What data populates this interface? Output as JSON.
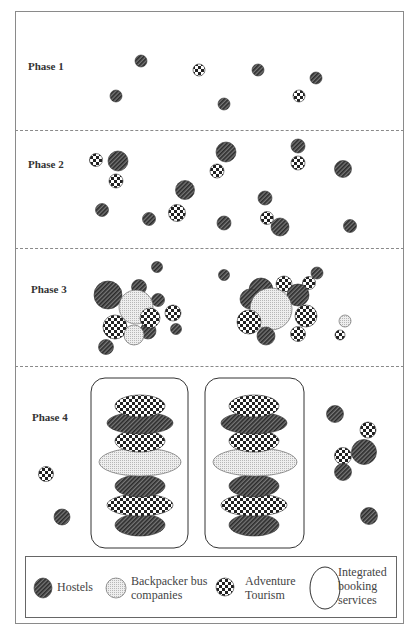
{
  "figure": {
    "phases": [
      {
        "label": "Phase 1"
      },
      {
        "label": "Phase 2"
      },
      {
        "label": "Phase 3"
      },
      {
        "label": "Phase 4"
      }
    ],
    "legend": {
      "hostels": "Hostels",
      "bus_line1": "Backpacker bus",
      "bus_line2": "companies",
      "adventure_line1": "Adventure",
      "adventure_line2": "Tourism",
      "booking_line1": "Integrated",
      "booking_line2": "booking",
      "booking_line3": "services"
    },
    "colors": {
      "hatch_dark": "#333333",
      "hatch_light": "#777777",
      "dot_fill": "#e8e8e8",
      "check_dark": "#222222",
      "frame": "#8a8a8a"
    }
  }
}
